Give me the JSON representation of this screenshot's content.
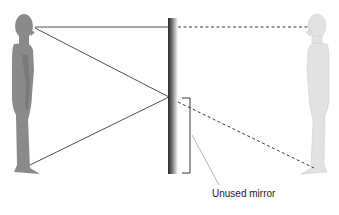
{
  "diagram": {
    "type": "plane-mirror-reflection",
    "label": "Unused mirror",
    "colors": {
      "person": "#8a8a8a",
      "image": "#e0e0e0",
      "lines": "#222222",
      "mirror_dark": "#333333",
      "mirror_light": "#ffffff"
    }
  }
}
